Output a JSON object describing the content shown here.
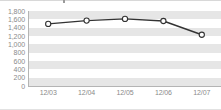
{
  "chart_data": {
    "type": "line",
    "title": "",
    "subtitle": "",
    "xlabel": "",
    "ylabel": "",
    "categories": [
      "12/03",
      "12/04",
      "12/05",
      "12/06",
      "12/07"
    ],
    "series": [
      {
        "name": "series-1",
        "values": [
          1490,
          1570,
          1610,
          1560,
          1230
        ],
        "line_color": "#333333",
        "marker_fill": "#ffffff",
        "marker_edge": "#333333",
        "marker": "circle"
      }
    ],
    "ylim": [
      0,
      1800
    ],
    "ytick_step": 200,
    "ytick_labels": [
      "1,800",
      "1,600",
      "1,400",
      "1,200",
      "1,000",
      "800",
      "600",
      "400",
      "200",
      "0"
    ],
    "ytick_values": [
      1800,
      1600,
      1400,
      1200,
      1000,
      800,
      600,
      400,
      200,
      0
    ],
    "xtick_labels": [
      "12/03",
      "12/04",
      "12/05",
      "12/06",
      "12/07"
    ],
    "grid": true,
    "grid_style": "alternating-horizontal-bands",
    "band_color": "#e6e6e6",
    "legend": false,
    "legend_position": "none",
    "axis_color": "#b4b4b4",
    "tick_label_color": "#8a8a8a",
    "background": "#ffffff"
  }
}
